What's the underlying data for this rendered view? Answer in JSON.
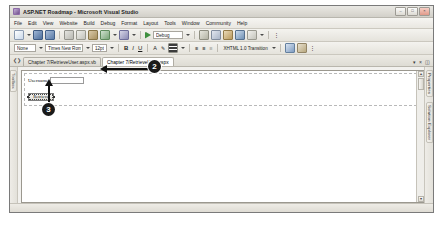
{
  "window": {
    "title": "ASP.NET Roadmap - Microsoft Visual Studio",
    "logo_icon": "visual-studio-logo-icon",
    "minimize_label": "–",
    "maximize_label": "□",
    "close_label": "×"
  },
  "menubar": {
    "items": [
      {
        "label": "File"
      },
      {
        "label": "Edit"
      },
      {
        "label": "View"
      },
      {
        "label": "Website"
      },
      {
        "label": "Build"
      },
      {
        "label": "Debug"
      },
      {
        "label": "Format"
      },
      {
        "label": "Layout"
      },
      {
        "label": "Tools"
      },
      {
        "label": "Window"
      },
      {
        "label": "Community"
      },
      {
        "label": "Help"
      }
    ]
  },
  "standard_toolbar": {
    "new_icon": "new-item-icon",
    "save_icon": "save-icon",
    "save_all_icon": "save-all-icon",
    "cut_icon": "cut-icon",
    "copy_icon": "copy-icon",
    "paste_icon": "paste-icon",
    "undo_icon": "undo-icon",
    "redo_icon": "redo-icon",
    "start_icon": "start-debug-icon",
    "config_value": "Debug",
    "solution_explorer_icon": "solution-explorer-icon",
    "properties_icon": "properties-window-icon",
    "toolbox_icon": "toolbox-icon",
    "object_browser_icon": "object-browser-icon",
    "find_icon": "find-icon",
    "overflow_icon": "toolbar-overflow-icon"
  },
  "formatting_toolbar": {
    "block_format_value": "None",
    "font_family_value": "Times New Roman",
    "font_size_value": "12pt",
    "bold_label": "B",
    "italic_label": "I",
    "underline_label": "U",
    "foreground_color_icon": "foreground-color-icon",
    "background_color_icon": "background-color-icon",
    "align_icon": "align-icon",
    "ordered_list_icon": "ordered-list-icon",
    "unordered_list_icon": "unordered-list-icon",
    "indent_icon": "indent-icon",
    "doctype_value": "XHTML 1.0 Transition",
    "style_icon": "style-application-icon",
    "css_icon": "css-properties-icon",
    "overflow_icon": "toolbar-overflow-icon"
  },
  "tabstrip": {
    "nav_icon": "tab-list-icon",
    "tabs": [
      {
        "label": "Chapter 7/RetrieveUser.aspx.vb",
        "active": false
      },
      {
        "label": "Chapter 7/RetrieveUser.aspx",
        "active": true
      }
    ],
    "dropdown_label": "▾",
    "close_label": "×",
    "split_icon": "split-window-icon"
  },
  "left_rail": {
    "tabs": [
      {
        "label": "Toolbox"
      }
    ]
  },
  "right_rail": {
    "tabs": [
      {
        "label": "Properties"
      },
      {
        "label": "Solution Explorer"
      }
    ]
  },
  "designer": {
    "username_label": "Username",
    "username_textbox_value": "",
    "retrieve_button_label": "Retrieve",
    "scroll_up_label": "▴",
    "scroll_down_label": "▾"
  },
  "callouts": [
    {
      "number": "2"
    },
    {
      "number": "3"
    }
  ],
  "colors": {
    "callout_fill": "#1a1a1a",
    "callout_text": "#ffffff",
    "chrome": "#e9e7e1",
    "canvas": "#ffffff"
  }
}
